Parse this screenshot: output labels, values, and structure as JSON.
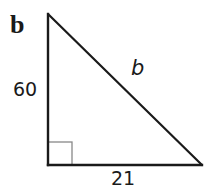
{
  "problem_label": "b",
  "triangle": {
    "type": "right-triangle",
    "vertices": {
      "top": [
        48,
        14
      ],
      "right_angle": [
        48,
        165
      ],
      "right": [
        202,
        165
      ]
    },
    "right_angle_marker_size": 24,
    "stroke_color": "#1a1a1a",
    "marker_color": "#888888"
  },
  "sides": {
    "vertical_leg": "60",
    "horizontal_leg": "21",
    "hypotenuse": "b"
  }
}
